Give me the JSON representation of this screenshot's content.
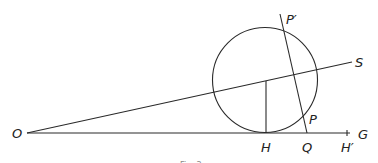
{
  "figure": {
    "labels": {
      "O": "O",
      "S": "S",
      "P_prime": "P′",
      "P": "P",
      "H": "H",
      "Q": "Q",
      "H_prime": "H′",
      "G": "G"
    },
    "caption": "Fig. 3"
  }
}
